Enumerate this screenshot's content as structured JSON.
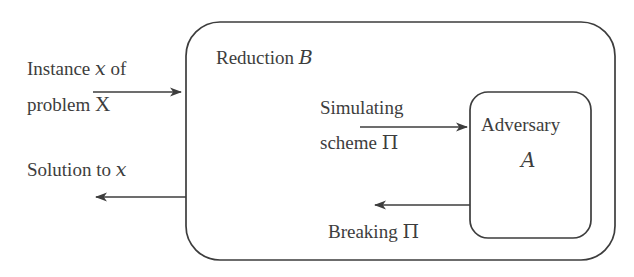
{
  "figure": {
    "kind": "cryptographic-reduction-diagram",
    "background_color": "#ffffff",
    "stroke_color": "#3d3d3d",
    "text_color": "#3d3d3d"
  },
  "boxes": {
    "reduction": {
      "label_prefix": "Reduction ",
      "symbol": "B",
      "full_label": "Reduction B",
      "x": 186,
      "y": 22,
      "width": 429,
      "height": 238,
      "corner_radius": 34
    },
    "adversary": {
      "label": "Adversary",
      "symbol": "A",
      "x": 470,
      "y": 92,
      "width": 121,
      "height": 146,
      "corner_radius": 18
    }
  },
  "labels": {
    "instance_line1_prefix": "Instance ",
    "instance_line1_symbol": "x",
    "instance_line1_suffix": " of",
    "instance_line2_prefix": "problem ",
    "instance_line2_symbol": "X",
    "solution_prefix": "Solution to ",
    "solution_symbol": "x",
    "simulating_line1": "Simulating",
    "simulating_line2_prefix": "scheme ",
    "simulating_line2_symbol": "Π",
    "breaking_prefix": "Breaking ",
    "breaking_symbol": "Π"
  },
  "arrows": [
    {
      "name": "instance-input-arrow",
      "direction": "right",
      "from_x": 93,
      "to_x": 182,
      "y": 92,
      "label": "Instance x of problem X"
    },
    {
      "name": "solution-output-arrow",
      "direction": "left",
      "from_x": 186,
      "to_x": 95,
      "y": 197,
      "label": "Solution to x"
    },
    {
      "name": "simulating-scheme-arrow",
      "direction": "right",
      "from_x": 360,
      "to_x": 468,
      "y": 127,
      "label": "Simulating scheme Π"
    },
    {
      "name": "breaking-scheme-arrow",
      "direction": "left",
      "from_x": 470,
      "to_x": 374,
      "y": 205,
      "label": "Breaking Π"
    }
  ]
}
